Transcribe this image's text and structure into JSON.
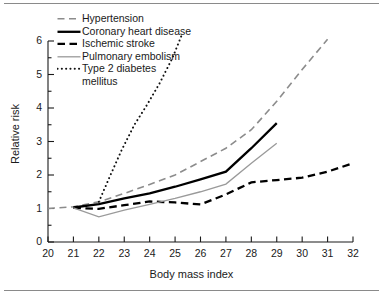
{
  "chart_data": {
    "type": "line",
    "title": "",
    "xlabel": "Body mass index",
    "ylabel": "Relative risk",
    "xlim": [
      20,
      32
    ],
    "ylim": [
      0,
      6.3
    ],
    "xticks": [
      20,
      21,
      22,
      23,
      24,
      25,
      26,
      27,
      28,
      29,
      30,
      31,
      32
    ],
    "yticks": [
      0,
      1,
      2,
      3,
      4,
      5,
      6
    ],
    "minor_tick_step": 0.5,
    "grid": false,
    "legend_position": "upper left",
    "series": [
      {
        "name": "Hypertension",
        "style": "dashed",
        "color": "#8c8c8c",
        "width": 1.6,
        "x": [
          20,
          21,
          22,
          23,
          24,
          25,
          26,
          27,
          28,
          29,
          30,
          31
        ],
        "y": [
          1.0,
          1.05,
          1.2,
          1.45,
          1.72,
          2.0,
          2.4,
          2.8,
          3.35,
          4.2,
          5.15,
          6.05
        ]
      },
      {
        "name": "Coronary heart disease",
        "style": "solid",
        "color": "#000000",
        "width": 2.3,
        "x": [
          21,
          22,
          23,
          24,
          25,
          26,
          27,
          28,
          29
        ],
        "y": [
          1.03,
          1.13,
          1.3,
          1.45,
          1.65,
          1.87,
          2.1,
          2.8,
          3.55
        ]
      },
      {
        "name": "Ischemic stroke",
        "style": "dashed-thick",
        "color": "#000000",
        "width": 2.3,
        "x": [
          21,
          22,
          23,
          24,
          25,
          26,
          27,
          28,
          29,
          30,
          31,
          32
        ],
        "y": [
          1.02,
          0.99,
          1.1,
          1.21,
          1.18,
          1.12,
          1.42,
          1.78,
          1.85,
          1.92,
          2.1,
          2.35
        ]
      },
      {
        "name": "Pulmonary embolism",
        "style": "solid-thin",
        "color": "#9a9a9a",
        "width": 1.3,
        "x": [
          21,
          22,
          23,
          24,
          25,
          26,
          27,
          28,
          29
        ],
        "y": [
          1.02,
          0.75,
          0.95,
          1.12,
          1.3,
          1.5,
          1.73,
          2.35,
          2.95
        ]
      },
      {
        "name": "Type 2 diabetes mellitus",
        "style": "dotted",
        "color": "#111111",
        "width": 2.0,
        "x": [
          22,
          22.4,
          22.9,
          23.4,
          23.9,
          24.4,
          24.9,
          25.3
        ],
        "y": [
          1.2,
          1.9,
          2.75,
          3.5,
          4.1,
          4.75,
          5.5,
          6.25
        ]
      }
    ],
    "legend_entries": [
      {
        "label": "Hypertension",
        "style": "dashed",
        "color": "#8c8c8c"
      },
      {
        "label": "Coronary heart disease",
        "style": "solid",
        "color": "#000000"
      },
      {
        "label": "Ischemic stroke",
        "style": "dashed-thick",
        "color": "#000000"
      },
      {
        "label": "Pulmonary embolism",
        "style": "solid-thin",
        "color": "#9a9a9a"
      },
      {
        "label": "Type 2 diabetes",
        "style": "dotted",
        "color": "#111111"
      }
    ],
    "legend_continuation": "mellitus"
  }
}
